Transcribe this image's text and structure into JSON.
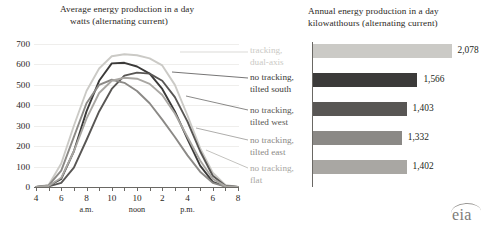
{
  "line_chart": {
    "title_line1": "Average energy production in a day",
    "title_line2": "watts (alternating current)",
    "y_ticks": [
      "700",
      "600",
      "500",
      "400",
      "300",
      "200",
      "100",
      "0"
    ],
    "x_ticks": [
      "4",
      "6",
      "8",
      "10",
      "10",
      "2",
      "4",
      "6",
      "8"
    ],
    "x_sub": {
      "am": "a.m.",
      "noon": "noon",
      "pm": "p.m."
    }
  },
  "bar_chart": {
    "title_line1": "Annual energy production in a day",
    "title_line2": "kilowatthours (alternating current)",
    "values_text": [
      "2,078",
      "1,566",
      "1,403",
      "1,332",
      "1,402"
    ]
  },
  "legend": [
    {
      "l1": "tracking,",
      "l2": "dual-axis",
      "color": "#cbcac6"
    },
    {
      "l1": "no tracking,",
      "l2": "tilted south",
      "color": "#3b3a39"
    },
    {
      "l1": "no tracking,",
      "l2": "tilted west",
      "color": "#585654"
    },
    {
      "l1": "no tracking,",
      "l2": "tilted east",
      "color": "#8b8986"
    },
    {
      "l1": "no tracking,",
      "l2": "flat",
      "color": "#a9a7a3"
    }
  ],
  "logo": {
    "text": "eia"
  },
  "chart_data": [
    {
      "type": "line",
      "title": "Average energy production in a day",
      "subtitle": "watts (alternating current)",
      "xlabel": "",
      "ylabel": "watts (alternating current)",
      "ylim": [
        0,
        700
      ],
      "xlim": [
        4,
        20
      ],
      "grid": true,
      "legend_position": "right",
      "x": [
        4,
        5,
        6,
        7,
        8,
        9,
        10,
        11,
        12,
        13,
        14,
        15,
        16,
        17,
        18,
        19,
        20
      ],
      "x_tick_labels": [
        "4",
        "6",
        "8",
        "10 a.m.",
        "10 noon",
        "2",
        "4 p.m.",
        "6",
        "8"
      ],
      "series": [
        {
          "name": "tracking, dual-axis",
          "color": "#cbcac6",
          "values": [
            0,
            10,
            115,
            300,
            470,
            580,
            640,
            650,
            645,
            630,
            595,
            500,
            350,
            190,
            70,
            10,
            0
          ]
        },
        {
          "name": "no tracking, tilted south",
          "color": "#3b3a39",
          "values": [
            0,
            5,
            40,
            175,
            370,
            520,
            605,
            608,
            590,
            555,
            480,
            370,
            235,
            105,
            25,
            3,
            0
          ]
        },
        {
          "name": "no tracking, tilted west",
          "color": "#585654",
          "values": [
            0,
            3,
            20,
            95,
            230,
            370,
            480,
            545,
            560,
            555,
            520,
            440,
            320,
            175,
            55,
            6,
            0
          ]
        },
        {
          "name": "no tracking, tilted east",
          "color": "#8b8986",
          "values": [
            0,
            8,
            80,
            245,
            410,
            500,
            525,
            510,
            470,
            410,
            330,
            245,
            155,
            75,
            20,
            2,
            0
          ]
        },
        {
          "name": "no tracking, flat",
          "color": "#a9a7a3",
          "values": [
            0,
            5,
            45,
            175,
            335,
            460,
            520,
            535,
            530,
            505,
            450,
            360,
            245,
            130,
            40,
            4,
            0
          ]
        }
      ]
    },
    {
      "type": "bar",
      "orientation": "horizontal",
      "title": "Annual energy production in a day",
      "subtitle": "kilowatthours (alternating current)",
      "xlabel": "kilowatthours (alternating current)",
      "ylabel": "",
      "categories": [
        "tracking, dual-axis",
        "no tracking, tilted south",
        "no tracking, tilted west",
        "no tracking, tilted east",
        "no tracking, flat"
      ],
      "values": [
        2078,
        1566,
        1403,
        1332,
        1402
      ],
      "value_labels": [
        "2,078",
        "1,566",
        "1,403",
        "1,332",
        "1,402"
      ],
      "colors": [
        "#cbcac6",
        "#3b3a39",
        "#585654",
        "#8b8986",
        "#a9a7a3"
      ],
      "xlim": [
        0,
        2400
      ],
      "grid": false
    }
  ]
}
